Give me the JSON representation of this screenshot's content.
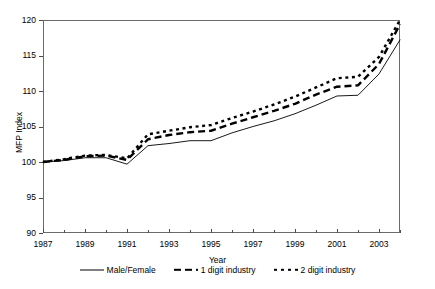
{
  "chart_data": {
    "type": "line",
    "title": "",
    "xlabel": "Year",
    "ylabel": "MFP Index",
    "xlim": [
      1987,
      2004
    ],
    "ylim": [
      90,
      120
    ],
    "ytick_step": 5,
    "yticks": [
      90,
      95,
      100,
      105,
      110,
      115,
      120
    ],
    "xticks_major": [
      1987,
      1989,
      1991,
      1993,
      1995,
      1997,
      1999,
      2001,
      2003
    ],
    "xticks_minor": [
      1988,
      1990,
      1992,
      1994,
      1996,
      1998,
      2000,
      2002,
      2004
    ],
    "grid": false,
    "legend_position": "bottom",
    "x": [
      1987,
      1988,
      1989,
      1990,
      1991,
      1992,
      1993,
      1994,
      1995,
      1996,
      1997,
      1998,
      1999,
      2000,
      2001,
      2002,
      2003,
      2004
    ],
    "series": [
      {
        "name": "Male/Female",
        "style": "solid",
        "values": [
          100.0,
          100.2,
          100.6,
          100.6,
          99.7,
          102.3,
          102.6,
          103.0,
          103.0,
          104.1,
          105.0,
          105.8,
          106.8,
          108.0,
          109.3,
          109.4,
          112.4,
          117.2
        ]
      },
      {
        "name": "1 digit industry",
        "style": "dashed",
        "values": [
          100.0,
          100.3,
          100.8,
          100.9,
          100.3,
          103.2,
          103.8,
          104.2,
          104.4,
          105.4,
          106.3,
          107.2,
          108.2,
          109.5,
          110.6,
          110.8,
          113.8,
          119.4
        ]
      },
      {
        "name": "2 digit industry",
        "style": "dotted",
        "values": [
          100.0,
          100.4,
          100.9,
          101.0,
          100.5,
          103.9,
          104.4,
          104.9,
          105.2,
          106.2,
          107.1,
          108.1,
          109.2,
          110.5,
          111.8,
          112.0,
          114.8,
          120.0
        ]
      }
    ]
  },
  "axes": {
    "y_title": "MFP Index",
    "x_title": "Year"
  }
}
